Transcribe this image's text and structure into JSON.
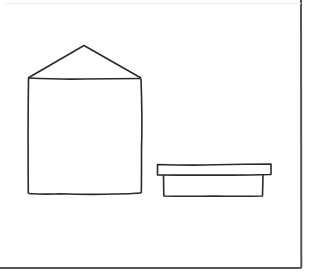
{
  "diagram": {
    "stroke_color": "#2a2a2a",
    "frame_color": "#555555",
    "background_color": "#ffffff",
    "frame": {
      "right_x": 301,
      "bottom_y": 268
    },
    "shapes": [
      {
        "name": "house",
        "roof": {
          "apex": [
            84,
            45
          ],
          "left": [
            28,
            78
          ],
          "right": [
            141,
            78
          ]
        },
        "body": {
          "x": 28,
          "y": 78,
          "width": 113,
          "height": 116
        }
      },
      {
        "name": "tray",
        "lid": {
          "x": 157,
          "y": 164,
          "width": 114,
          "height": 11
        },
        "base": {
          "x": 163,
          "y": 175,
          "width": 100,
          "height": 21
        }
      }
    ]
  }
}
